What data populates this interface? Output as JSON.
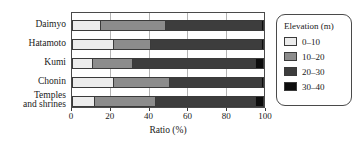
{
  "chart_data": {
    "type": "bar",
    "orientation": "horizontal",
    "stacked": true,
    "normalized": true,
    "title": "",
    "xlabel": "Ratio (%)",
    "ylabel": "",
    "xlim": [
      0,
      100
    ],
    "xticks": [
      0,
      20,
      40,
      60,
      80,
      100
    ],
    "xticklabels": [
      "0",
      "20",
      "40",
      "60",
      "80",
      "100"
    ],
    "grid": "vertical",
    "legend_position": "right-outside",
    "legend_title": "Elevation (m)",
    "categories": [
      "Daimyo",
      "Hatamoto",
      "Kumi",
      "Chonin",
      "Temples and shrines"
    ],
    "series": [
      {
        "name": "0–10",
        "color": "#ececec",
        "values": [
          15,
          22,
          11,
          22,
          12
        ]
      },
      {
        "name": "10–20",
        "color": "#8c8c8c",
        "values": [
          34,
          19,
          21,
          29,
          32
        ]
      },
      {
        "name": "20–30",
        "color": "#3d3d3d",
        "values": [
          50,
          58,
          64,
          48,
          52
        ]
      },
      {
        "name": "30–40",
        "color": "#0d0d0d",
        "values": [
          1,
          1,
          4,
          1,
          4
        ]
      }
    ]
  },
  "axis": {
    "x_title": "Ratio (%)",
    "tick_labels": [
      "0",
      "20",
      "40",
      "60",
      "80",
      "100"
    ]
  },
  "categories": [
    {
      "label": "Daimyo",
      "lines": [
        "Daimyo"
      ]
    },
    {
      "label": "Hatamoto",
      "lines": [
        "Hatamoto"
      ]
    },
    {
      "label": "Kumi",
      "lines": [
        "Kumi"
      ]
    },
    {
      "label": "Chonin",
      "lines": [
        "Chonin"
      ]
    },
    {
      "label": "Temples and shrines",
      "lines": [
        "Temples",
        "and shrines"
      ]
    }
  ],
  "legend": {
    "title": "Elevation (m)",
    "items": [
      {
        "label": "0–10",
        "color": "#ececec"
      },
      {
        "label": "10–20",
        "color": "#8c8c8c"
      },
      {
        "label": "20–30",
        "color": "#3d3d3d"
      },
      {
        "label": "30–40",
        "color": "#0d0d0d"
      }
    ]
  },
  "colors": {
    "axis": "#4a4a4a",
    "grid": "#b4b4b4",
    "text": "#1a1a1a",
    "background": "#ffffff"
  }
}
